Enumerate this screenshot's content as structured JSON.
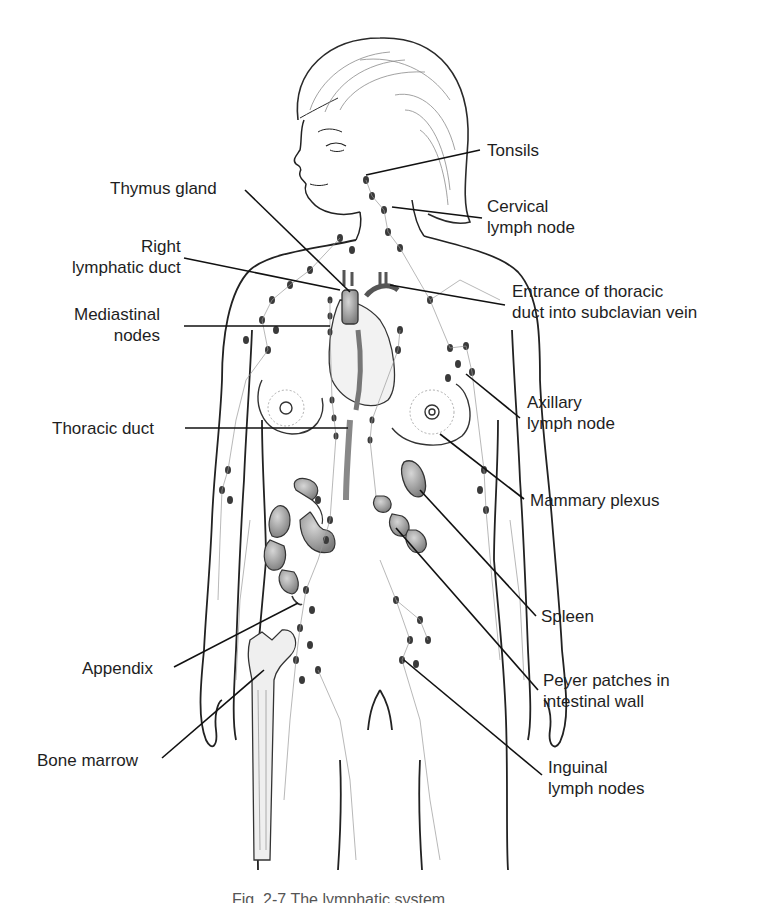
{
  "figure": {
    "caption": "Fig. 2-7 The lymphatic system"
  },
  "labels": {
    "left": [
      {
        "id": "thymus",
        "lines": [
          "Thymus gland"
        ]
      },
      {
        "id": "right-lymphatic-duct",
        "lines": [
          "Right",
          "lymphatic duct"
        ]
      },
      {
        "id": "mediastinal",
        "lines": [
          "Mediastinal",
          "nodes"
        ]
      },
      {
        "id": "thoracic-duct",
        "lines": [
          "Thoracic duct"
        ]
      },
      {
        "id": "appendix",
        "lines": [
          "Appendix"
        ]
      },
      {
        "id": "bone-marrow",
        "lines": [
          "Bone marrow"
        ]
      }
    ],
    "right": [
      {
        "id": "tonsils",
        "lines": [
          "Tonsils"
        ]
      },
      {
        "id": "cervical",
        "lines": [
          "Cervical",
          "lymph node"
        ]
      },
      {
        "id": "thoracic-entrance",
        "lines": [
          "Entrance of thoracic",
          "duct into subclavian vein"
        ]
      },
      {
        "id": "axillary",
        "lines": [
          "Axillary",
          "lymph node"
        ]
      },
      {
        "id": "mammary",
        "lines": [
          "Mammary plexus"
        ]
      },
      {
        "id": "spleen",
        "lines": [
          "Spleen"
        ]
      },
      {
        "id": "peyer",
        "lines": [
          "Peyer patches in",
          "intestinal wall"
        ]
      },
      {
        "id": "inguinal",
        "lines": [
          "Inguinal",
          "lymph nodes"
        ]
      }
    ]
  },
  "colors": {
    "line": "#1a1a1a",
    "organ_fill": "#9a9a9a",
    "node_fill": "#3a3a3a",
    "vessel": "#8c8c8c"
  }
}
